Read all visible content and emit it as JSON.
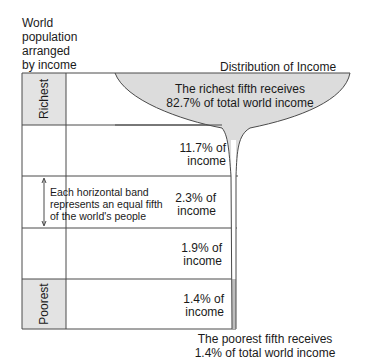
{
  "y_axis_title": [
    "World",
    "population",
    "arranged",
    "by income"
  ],
  "diagram_title": "Distribution of Income",
  "bands": [
    {
      "side_label": "Richest",
      "income_label": [
        "The richest fifth receives",
        "82.7% of total world income"
      ],
      "share": 82.7
    },
    {
      "side_label": "",
      "income_label": [
        "11.7% of",
        "income"
      ],
      "share": 11.7
    },
    {
      "side_label": "",
      "income_label": [
        "2.3% of",
        "income"
      ],
      "share": 2.3
    },
    {
      "side_label": "",
      "income_label": [
        "1.9% of",
        "income"
      ],
      "share": 1.9
    },
    {
      "side_label": "Poorest",
      "income_label": [
        "1.4% of",
        "income"
      ],
      "share": 1.4
    }
  ],
  "note": [
    "Each horizontal band",
    "represents an equal fifth",
    "of the world's people"
  ],
  "bottom_caption": [
    "The poorest fifth receives",
    "1.4% of total world income"
  ],
  "colors": {
    "band_fill": "#e3e3e3",
    "funnel_fill": "#dcdcdc",
    "line": "#4a4a4a"
  }
}
